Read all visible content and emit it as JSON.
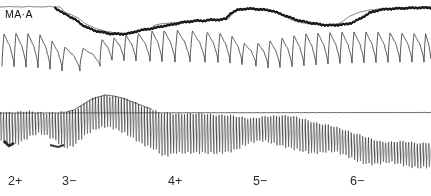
{
  "figure": {
    "width": 431,
    "height": 196,
    "background_color": "#ffffff",
    "ink_color": "#1a1a1a",
    "kind": "physiological-chart-recorder-trace"
  },
  "channel_label": {
    "text": "MA·A",
    "name": "channel-label-ma-a"
  },
  "axis": {
    "tick_labels": [
      {
        "text": "2+",
        "x": 8
      },
      {
        "text": "3−",
        "x": 62
      },
      {
        "text": "4+",
        "x": 168
      },
      {
        "text": "5−",
        "x": 253
      },
      {
        "text": "6−",
        "x": 350
      }
    ]
  },
  "chart_data": {
    "type": "line",
    "title": "",
    "subtitle": "",
    "xlabel": "",
    "ylabel": "",
    "grid": false,
    "legend": "none",
    "xlim": [
      0,
      431
    ],
    "ylim_top_panel": [
      0,
      85
    ],
    "ylim_bottom_panel": [
      85,
      170
    ],
    "annotations": [
      {
        "text": "MA·A",
        "x": 5,
        "y": 14,
        "role": "channel-identifier"
      },
      {
        "text": "2+",
        "x": 8,
        "y": 186,
        "role": "x-axis-event-marker"
      },
      {
        "text": "3−",
        "x": 62,
        "y": 186,
        "role": "x-axis-event-marker"
      },
      {
        "text": "4+",
        "x": 168,
        "y": 186,
        "role": "x-axis-event-marker"
      },
      {
        "text": "5−",
        "x": 253,
        "y": 186,
        "role": "x-axis-event-marker"
      },
      {
        "text": "6−",
        "x": 350,
        "y": 186,
        "role": "x-axis-event-marker"
      }
    ],
    "series": [
      {
        "name": "upper-envelope-thin-line",
        "panel": "top",
        "style": "thin",
        "description": "Near-flat upper boundary line with small step transitions",
        "x": [
          0,
          10,
          20,
          30,
          40,
          50,
          55,
          60,
          63,
          66,
          70,
          74,
          78,
          82,
          86,
          90,
          95,
          100,
          105,
          110,
          115,
          120,
          125,
          130,
          135,
          140,
          145,
          150,
          152,
          155,
          160,
          170,
          180,
          190,
          200,
          210,
          220,
          228,
          232,
          235,
          238,
          242,
          246,
          250,
          255,
          262,
          270,
          278,
          286,
          292,
          298,
          304,
          310,
          316,
          320,
          325,
          330,
          336,
          340,
          350,
          360,
          370,
          380,
          390,
          400,
          410,
          420,
          431
        ],
        "y": [
          7,
          6.5,
          7,
          6.5,
          7,
          6.5,
          7,
          7,
          10,
          13,
          14,
          16,
          18,
          21,
          24,
          26,
          28,
          30,
          31,
          32,
          33,
          33,
          33.5,
          34,
          33,
          31,
          30,
          29,
          27,
          25,
          24,
          23,
          22,
          21,
          21,
          20,
          20,
          19,
          14,
          11,
          10,
          9,
          9,
          9,
          9,
          9,
          10,
          13,
          17,
          20,
          22,
          23,
          24,
          24.5,
          25,
          25,
          24.5,
          24,
          23,
          16,
          12,
          10,
          9,
          8.5,
          8,
          7.5,
          7.5,
          7
        ]
      },
      {
        "name": "mean-arterial-pressure-dark-step-trace",
        "panel": "top",
        "style": "thick-dark",
        "description": "Heavy dark stepped trace descending then recovering twice",
        "x": [
          55,
          58,
          61,
          64,
          67,
          70,
          74,
          78,
          82,
          86,
          90,
          95,
          100,
          105,
          110,
          115,
          120,
          126,
          132,
          138,
          144,
          150,
          156,
          160,
          165,
          172,
          180,
          188,
          196,
          204,
          212,
          220,
          226,
          230,
          234,
          238,
          242,
          246,
          252,
          258,
          264,
          272,
          280,
          288,
          296,
          304,
          310,
          316,
          322,
          328,
          334,
          340,
          346,
          352,
          360,
          370,
          380,
          392,
          404,
          416,
          431
        ],
        "y": [
          8,
          10,
          12,
          14,
          15,
          17,
          19,
          22,
          25,
          27,
          29,
          31,
          32,
          33,
          34,
          34,
          34.5,
          34,
          33,
          31,
          30,
          29,
          28,
          27,
          26,
          25,
          23,
          22,
          21,
          21,
          20,
          20,
          19,
          14,
          12,
          10,
          9.5,
          9,
          9,
          9.5,
          10,
          11,
          14,
          17,
          20,
          22,
          23,
          24,
          25,
          25.5,
          25.5,
          25,
          24.5,
          23,
          19,
          13,
          10,
          9,
          8.5,
          8,
          8
        ]
      },
      {
        "name": "pulse-pressure-waveform",
        "panel": "top",
        "style": "thin",
        "description": "Sharp-rise slow-decay arterial pulse waveform, ~22 beats; amplitude and baseline vary across the record",
        "beat_count": 22,
        "baseline_y_range": [
          55,
          72
        ],
        "peak_y_range": [
          28,
          52
        ]
      },
      {
        "name": "dense-oscillation-trace",
        "panel": "bottom",
        "style": "dense-spikes",
        "description": "High-frequency dense spike train whose envelope rises and falls; upper envelope clipped flat after x≈160",
        "spike_count": 150,
        "envelope_upper_x": [
          0,
          10,
          20,
          30,
          40,
          50,
          58,
          66,
          74,
          82,
          90,
          98,
          106,
          114,
          122,
          130,
          138,
          146,
          154,
          158,
          162,
          170,
          180,
          190,
          200,
          210,
          220,
          230,
          240,
          250,
          258,
          266,
          274,
          282,
          290,
          298,
          306,
          314,
          322,
          330,
          338,
          346,
          354,
          362,
          370,
          380,
          390,
          400,
          410,
          420,
          431
        ],
        "envelope_upper_y": [
          112,
          112,
          112,
          112,
          112,
          113,
          113,
          112,
          110,
          105,
          100,
          97,
          95,
          96,
          98,
          101,
          104,
          107,
          110,
          112,
          113,
          113,
          113,
          114,
          114,
          114,
          115,
          116,
          117,
          118,
          118,
          117,
          116,
          115,
          116,
          118,
          120,
          122,
          124,
          126,
          128,
          130,
          133,
          136,
          139,
          141,
          142,
          142,
          142,
          143,
          143
        ],
        "envelope_lower_x": [
          0,
          8,
          16,
          24,
          32,
          40,
          48,
          56,
          62,
          68,
          74,
          80,
          88,
          96,
          104,
          112,
          120,
          128,
          136,
          144,
          152,
          158,
          162,
          168,
          176,
          184,
          192,
          200,
          208,
          216,
          224,
          232,
          240,
          248,
          256,
          262,
          270,
          278,
          286,
          294,
          302,
          310,
          318,
          326,
          334,
          342,
          350,
          358,
          366,
          374,
          382,
          390,
          400,
          410,
          420,
          431
        ],
        "envelope_lower_y": [
          140,
          145,
          144,
          140,
          136,
          134,
          136,
          140,
          146,
          148,
          146,
          140,
          133,
          128,
          126,
          128,
          132,
          136,
          140,
          144,
          148,
          152,
          157,
          156,
          153,
          152,
          152,
          153,
          154,
          154,
          152,
          150,
          147,
          144,
          142,
          141,
          142,
          144,
          147,
          150,
          152,
          153,
          152,
          151,
          152,
          155,
          158,
          161,
          163,
          164,
          164,
          163,
          164,
          166,
          168,
          168
        ]
      },
      {
        "name": "bottom-panel-baseline",
        "panel": "bottom",
        "style": "thin-horizontal",
        "description": "Flat horizontal reference line across bottom panel at constant level",
        "y": 113,
        "x_start": 0,
        "x_end": 431
      }
    ]
  }
}
